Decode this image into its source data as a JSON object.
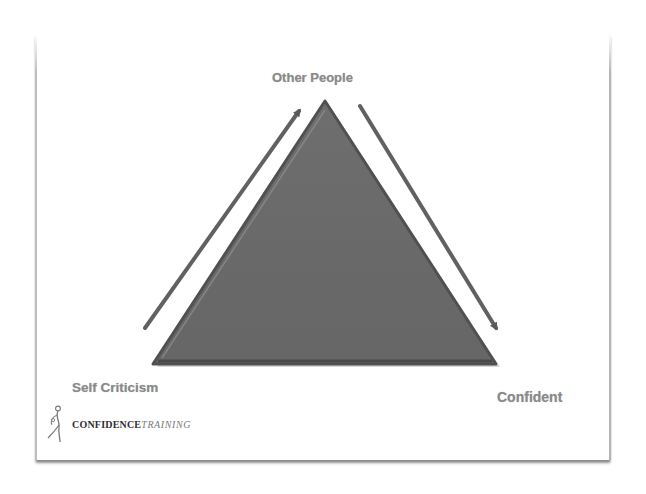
{
  "diagram": {
    "type": "triangle-cycle",
    "vertices": {
      "top": "Other People",
      "bottom_left": "Self Criticism",
      "bottom_right": "Confident"
    },
    "arrows": [
      {
        "from": "Self Criticism",
        "to": "Other People",
        "direction": "up-right"
      },
      {
        "from": "Other People",
        "to": "Confident",
        "direction": "down-right"
      }
    ],
    "colors": {
      "triangle_fill": "#6a6a6a",
      "triangle_edge": "#4f4f4f",
      "arrow": "#5f5f5f",
      "label": "#8a8a8a"
    }
  },
  "logo": {
    "icon": "figure-icon",
    "brand_bold": "CONFIDENCE",
    "brand_italic": "TRAINING"
  }
}
